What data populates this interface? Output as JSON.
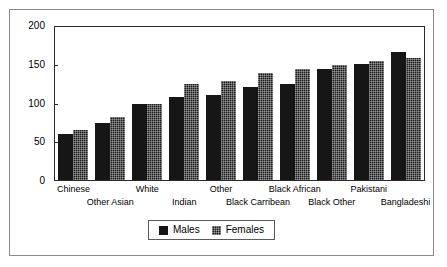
{
  "chart_data": {
    "type": "bar",
    "title": "",
    "subtitle": "",
    "xlabel": "",
    "ylabel": "",
    "ylim": [
      0,
      200
    ],
    "yticks": [
      0,
      50,
      100,
      150,
      200
    ],
    "ytick_labels": [
      "0",
      "50",
      "100",
      "150",
      "200"
    ],
    "grid": false,
    "legend_position": "bottom",
    "categories": [
      "Chinese",
      "Other Asian",
      "White",
      "Indian",
      "Other",
      "Black Carribean",
      "Black African",
      "Black Other",
      "Pakistani",
      "Bangladeshi"
    ],
    "series": [
      {
        "name": "Males",
        "values": [
          60,
          75,
          100,
          108,
          111,
          121,
          125,
          145,
          152,
          167
        ],
        "color": "#161616"
      },
      {
        "name": "Females",
        "values": [
          65,
          82,
          100,
          125,
          130,
          140,
          145,
          150,
          155,
          160
        ],
        "color": "#1d1d1d"
      }
    ]
  },
  "legend": {
    "items": [
      {
        "label": "Males"
      },
      {
        "label": "Females"
      }
    ]
  }
}
